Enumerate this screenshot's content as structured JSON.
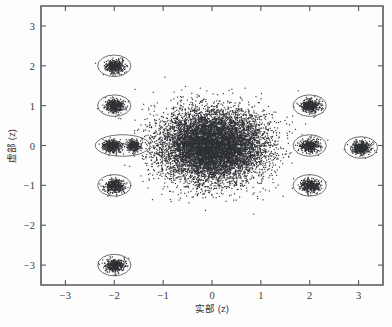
{
  "figure": {
    "background_color": "#fdfdfd",
    "axis_color": "#555a5e",
    "point_color": "#2f3134",
    "ellipse_color": "#5a5f63"
  },
  "axes": {
    "xlabel": "实部 (z)",
    "ylabel": "虚部 (z)",
    "x_ticks": [
      "-3",
      "-2",
      "-1",
      "0",
      "1",
      "2",
      "3"
    ],
    "y_ticks": [
      "3",
      "2",
      "1",
      "0",
      "-1",
      "-2",
      "-3"
    ]
  },
  "chart_data": {
    "type": "scatter",
    "title": "",
    "xlabel": "实部 (z)",
    "ylabel": "虚部 (z)",
    "xlim": [
      -3.5,
      3.5
    ],
    "ylim": [
      -3.5,
      3.5
    ],
    "xticks": [
      -3,
      -2,
      -1,
      0,
      1,
      2,
      3
    ],
    "yticks": [
      -3,
      -2,
      -1,
      0,
      1,
      2,
      3
    ],
    "grid": false,
    "legend": "none",
    "clusters": [
      {
        "name": "central-cloud",
        "cx": 0.0,
        "cy": 0.0,
        "rx": 1.1,
        "ry": 0.92,
        "n": 9000,
        "outlined": false
      },
      {
        "name": "cluster-m2-p2",
        "cx": -2.0,
        "cy": 2.0,
        "rx": 0.2,
        "ry": 0.17,
        "n": 420,
        "outlined": true,
        "ellipse_rx": 0.34,
        "ellipse_ry": 0.27
      },
      {
        "name": "cluster-m2-p1",
        "cx": -2.0,
        "cy": 1.0,
        "rx": 0.2,
        "ry": 0.17,
        "n": 420,
        "outlined": true,
        "ellipse_rx": 0.34,
        "ellipse_ry": 0.27
      },
      {
        "name": "cluster-m2-0",
        "cx": -2.05,
        "cy": 0.0,
        "rx": 0.2,
        "ry": 0.17,
        "n": 430,
        "outlined": false
      },
      {
        "name": "cluster-m165-0",
        "cx": -1.62,
        "cy": 0.0,
        "rx": 0.14,
        "ry": 0.15,
        "n": 300,
        "outlined": false
      },
      {
        "name": "cluster-m2-m1",
        "cx": -2.0,
        "cy": -1.0,
        "rx": 0.2,
        "ry": 0.17,
        "n": 420,
        "outlined": true,
        "ellipse_rx": 0.34,
        "ellipse_ry": 0.27
      },
      {
        "name": "cluster-m2-m3",
        "cx": -2.0,
        "cy": -3.0,
        "rx": 0.2,
        "ry": 0.17,
        "n": 420,
        "outlined": true,
        "ellipse_rx": 0.34,
        "ellipse_ry": 0.27
      },
      {
        "name": "cluster-p2-p1",
        "cx": 2.0,
        "cy": 1.0,
        "rx": 0.2,
        "ry": 0.17,
        "n": 420,
        "outlined": true,
        "ellipse_rx": 0.34,
        "ellipse_ry": 0.27
      },
      {
        "name": "cluster-p2-0",
        "cx": 2.0,
        "cy": 0.0,
        "rx": 0.2,
        "ry": 0.17,
        "n": 420,
        "outlined": true,
        "ellipse_rx": 0.34,
        "ellipse_ry": 0.27
      },
      {
        "name": "cluster-p2-m1",
        "cx": 2.0,
        "cy": -1.0,
        "rx": 0.2,
        "ry": 0.17,
        "n": 420,
        "outlined": true,
        "ellipse_rx": 0.34,
        "ellipse_ry": 0.27
      },
      {
        "name": "cluster-p3-0",
        "cx": 3.05,
        "cy": -0.05,
        "rx": 0.2,
        "ry": 0.17,
        "n": 420,
        "outlined": true,
        "ellipse_rx": 0.34,
        "ellipse_ry": 0.27
      }
    ],
    "wide_ellipses": [
      {
        "name": "ellipse-left-pair",
        "cx": -1.83,
        "cy": 0.0,
        "rx": 0.56,
        "ry": 0.27
      }
    ]
  }
}
